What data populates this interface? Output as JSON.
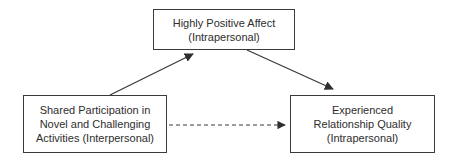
{
  "diagram": {
    "type": "mediation-path-model",
    "nodes": {
      "top": {
        "id": "highly-positive-affect",
        "lines": [
          "Highly Positive Affect",
          "(Intrapersonal)"
        ]
      },
      "left": {
        "id": "shared-participation",
        "lines": [
          "Shared Participation in",
          "Novel and Challenging",
          "Activities (Interpersonal)"
        ]
      },
      "right": {
        "id": "experienced-relationship-quality",
        "lines": [
          "Experienced",
          "Relationship Quality",
          "(Intrapersonal)"
        ]
      }
    },
    "edges": [
      {
        "from": "shared-participation",
        "to": "highly-positive-affect",
        "style": "solid"
      },
      {
        "from": "highly-positive-affect",
        "to": "experienced-relationship-quality",
        "style": "solid"
      },
      {
        "from": "shared-participation",
        "to": "experienced-relationship-quality",
        "style": "dashed"
      }
    ],
    "colors": {
      "stroke": "#3a3a3a",
      "text": "#2e2e2e",
      "background": "#ffffff"
    }
  }
}
